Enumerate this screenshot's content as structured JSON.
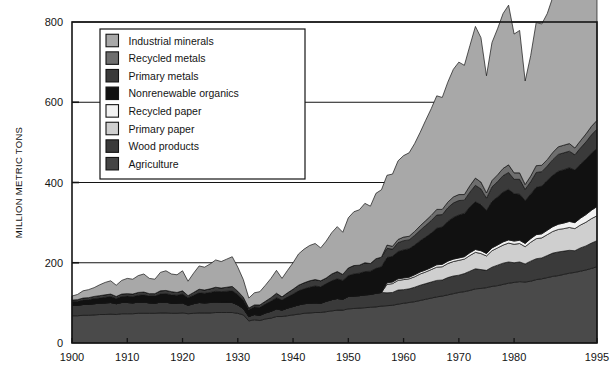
{
  "chart_data": {
    "type": "area",
    "title": "",
    "subtitle": "",
    "xlabel": "",
    "ylabel": "MILLION METRIC TONS",
    "xlim": [
      1900,
      1995
    ],
    "ylim": [
      0,
      800
    ],
    "ytick_labels": [
      "0",
      "200",
      "400",
      "600",
      "800"
    ],
    "yticks": [
      0,
      200,
      400,
      600,
      800
    ],
    "xtick_labels": [
      "1900",
      "1910",
      "1920",
      "1930",
      "1940",
      "1950",
      "1960",
      "1970",
      "1980",
      "1995"
    ],
    "xticks": [
      1900,
      1910,
      1920,
      1930,
      1940,
      1950,
      1960,
      1970,
      1980,
      1995
    ],
    "grid": "horizontal",
    "stacked": true,
    "legend_position": "upper-left-inset",
    "x": [
      1900,
      1901,
      1902,
      1903,
      1904,
      1905,
      1906,
      1907,
      1908,
      1909,
      1910,
      1911,
      1912,
      1913,
      1914,
      1915,
      1916,
      1917,
      1918,
      1919,
      1920,
      1921,
      1922,
      1923,
      1924,
      1925,
      1926,
      1927,
      1928,
      1929,
      1930,
      1931,
      1932,
      1933,
      1934,
      1935,
      1936,
      1937,
      1938,
      1939,
      1940,
      1941,
      1942,
      1943,
      1944,
      1945,
      1946,
      1947,
      1948,
      1949,
      1950,
      1951,
      1952,
      1953,
      1954,
      1955,
      1956,
      1957,
      1958,
      1959,
      1960,
      1961,
      1962,
      1963,
      1964,
      1965,
      1966,
      1967,
      1968,
      1969,
      1970,
      1971,
      1972,
      1973,
      1974,
      1975,
      1976,
      1977,
      1978,
      1979,
      1980,
      1981,
      1982,
      1983,
      1984,
      1985,
      1986,
      1987,
      1988,
      1989,
      1990,
      1991,
      1992,
      1993,
      1994,
      1995
    ],
    "series": [
      {
        "name": "Agriculture",
        "color": "#4a4a4a",
        "values": [
          68,
          68,
          69,
          69,
          70,
          71,
          71,
          72,
          71,
          73,
          73,
          73,
          74,
          74,
          74,
          74,
          75,
          75,
          74,
          74,
          75,
          73,
          74,
          75,
          75,
          75,
          76,
          76,
          76,
          76,
          74,
          70,
          55,
          58,
          56,
          60,
          62,
          66,
          66,
          68,
          70,
          72,
          74,
          75,
          76,
          76,
          78,
          80,
          82,
          82,
          85,
          86,
          87,
          88,
          89,
          90,
          92,
          93,
          94,
          97,
          99,
          101,
          103,
          106,
          109,
          112,
          115,
          117,
          120,
          123,
          126,
          128,
          131,
          135,
          136,
          138,
          141,
          143,
          146,
          149,
          151,
          153,
          152,
          154,
          158,
          160,
          163,
          166,
          168,
          171,
          174,
          176,
          179,
          182,
          186,
          190
        ]
      },
      {
        "name": "Wood products",
        "color": "#3a3a3a",
        "values": [
          26,
          26,
          27,
          27,
          28,
          28,
          29,
          29,
          27,
          28,
          28,
          27,
          28,
          28,
          26,
          25,
          27,
          27,
          25,
          25,
          25,
          21,
          24,
          26,
          25,
          26,
          26,
          25,
          25,
          25,
          21,
          16,
          11,
          13,
          13,
          15,
          17,
          19,
          16,
          19,
          21,
          23,
          24,
          24,
          24,
          23,
          26,
          28,
          29,
          27,
          31,
          31,
          31,
          32,
          32,
          34,
          34,
          32,
          32,
          35,
          34,
          34,
          36,
          38,
          39,
          40,
          41,
          40,
          43,
          44,
          43,
          45,
          48,
          50,
          47,
          43,
          48,
          51,
          53,
          53,
          49,
          49,
          45,
          50,
          52,
          52,
          55,
          58,
          59,
          58,
          57,
          54,
          58,
          60,
          63,
          65
        ]
      },
      {
        "name": "Primary paper",
        "color": "#cfcfcf",
        "values": [
          0,
          0,
          0,
          0,
          0,
          0,
          0,
          0,
          0,
          0,
          0,
          0,
          0,
          0,
          0,
          0,
          0,
          0,
          0,
          0,
          0,
          0,
          0,
          0,
          0,
          0,
          0,
          0,
          0,
          0,
          0,
          0,
          0,
          0,
          0,
          0,
          0,
          0,
          0,
          0,
          0,
          0,
          0,
          0,
          0,
          0,
          0,
          0,
          0,
          0,
          0,
          0,
          0,
          0,
          0,
          0,
          0,
          21,
          22,
          24,
          25,
          25,
          26,
          28,
          29,
          31,
          33,
          33,
          35,
          36,
          37,
          36,
          39,
          41,
          40,
          36,
          41,
          43,
          45,
          47,
          46,
          46,
          43,
          47,
          50,
          50,
          52,
          54,
          56,
          56,
          57,
          55,
          57,
          59,
          61,
          62
        ]
      },
      {
        "name": "Recycled paper",
        "color": "#f2f2f2",
        "values": [
          0,
          0,
          0,
          0,
          0,
          0,
          0,
          0,
          0,
          0,
          0,
          0,
          0,
          0,
          0,
          0,
          0,
          0,
          0,
          0,
          0,
          0,
          0,
          0,
          0,
          0,
          0,
          0,
          0,
          0,
          0,
          0,
          0,
          0,
          0,
          0,
          0,
          0,
          0,
          0,
          0,
          0,
          0,
          0,
          0,
          0,
          0,
          0,
          0,
          0,
          0,
          0,
          0,
          0,
          0,
          0,
          0,
          4,
          4,
          4,
          4,
          4,
          5,
          5,
          5,
          5,
          6,
          6,
          6,
          6,
          6,
          6,
          7,
          7,
          7,
          6,
          7,
          7,
          8,
          8,
          8,
          8,
          8,
          9,
          10,
          10,
          11,
          12,
          13,
          14,
          15,
          15,
          17,
          19,
          21,
          23
        ]
      },
      {
        "name": "Nonrenewable organics",
        "color": "#111111",
        "values": [
          9,
          10,
          11,
          12,
          13,
          13,
          14,
          15,
          13,
          15,
          16,
          16,
          17,
          18,
          17,
          18,
          20,
          21,
          21,
          20,
          22,
          19,
          21,
          24,
          24,
          25,
          27,
          27,
          28,
          29,
          26,
          22,
          17,
          19,
          20,
          22,
          25,
          28,
          25,
          28,
          31,
          35,
          37,
          40,
          42,
          41,
          44,
          47,
          49,
          47,
          52,
          55,
          56,
          58,
          58,
          62,
          64,
          63,
          64,
          68,
          70,
          71,
          74,
          78,
          82,
          86,
          91,
          93,
          99,
          104,
          107,
          108,
          114,
          119,
          115,
          107,
          116,
          120,
          124,
          126,
          118,
          115,
          107,
          111,
          118,
          119,
          124,
          128,
          132,
          133,
          134,
          131,
          135,
          138,
          142,
          145
        ]
      },
      {
        "name": "Primary metals",
        "color": "#3a3a3a",
        "values": [
          4,
          4,
          5,
          5,
          5,
          6,
          6,
          6,
          5,
          6,
          6,
          6,
          7,
          7,
          6,
          6,
          8,
          8,
          8,
          7,
          8,
          5,
          7,
          9,
          8,
          9,
          10,
          9,
          10,
          11,
          8,
          6,
          4,
          5,
          6,
          7,
          9,
          11,
          8,
          10,
          12,
          14,
          15,
          16,
          16,
          15,
          14,
          17,
          18,
          15,
          19,
          21,
          20,
          22,
          19,
          24,
          24,
          23,
          18,
          22,
          23,
          22,
          24,
          26,
          29,
          31,
          33,
          31,
          34,
          36,
          36,
          33,
          37,
          41,
          39,
          31,
          36,
          38,
          41,
          42,
          36,
          37,
          28,
          31,
          37,
          36,
          36,
          39,
          42,
          42,
          41,
          38,
          40,
          43,
          46,
          48
        ]
      },
      {
        "name": "Recycled metals",
        "color": "#6e6e6e",
        "values": [
          0,
          0,
          0,
          0,
          0,
          0,
          0,
          0,
          0,
          0,
          0,
          0,
          0,
          0,
          0,
          0,
          0,
          0,
          0,
          0,
          0,
          0,
          0,
          0,
          0,
          0,
          0,
          0,
          0,
          0,
          0,
          0,
          0,
          0,
          0,
          0,
          0,
          0,
          0,
          0,
          0,
          0,
          0,
          0,
          0,
          0,
          0,
          0,
          0,
          0,
          0,
          0,
          0,
          0,
          0,
          0,
          0,
          8,
          7,
          8,
          9,
          9,
          10,
          11,
          12,
          13,
          14,
          13,
          14,
          15,
          15,
          14,
          16,
          18,
          17,
          13,
          16,
          17,
          18,
          19,
          16,
          16,
          12,
          14,
          17,
          16,
          16,
          18,
          19,
          19,
          19,
          17,
          18,
          20,
          21,
          22
        ]
      },
      {
        "name": "Industrial minerals",
        "color": "#a8a8a8",
        "values": [
          10,
          13,
          18,
          20,
          22,
          27,
          31,
          33,
          28,
          34,
          38,
          37,
          42,
          45,
          38,
          36,
          46,
          49,
          44,
          44,
          50,
          36,
          48,
          58,
          57,
          62,
          68,
          66,
          70,
          74,
          60,
          44,
          25,
          30,
          33,
          40,
          48,
          57,
          46,
          56,
          66,
          78,
          84,
          88,
          90,
          82,
          92,
          103,
          112,
          105,
          125,
          134,
          138,
          148,
          143,
          163,
          168,
          174,
          180,
          196,
          203,
          208,
          219,
          233,
          250,
          266,
          283,
          279,
          299,
          318,
          330,
          322,
          349,
          378,
          360,
          292,
          344,
          364,
          386,
          398,
          346,
          355,
          258,
          300,
          357,
          352,
          364,
          387,
          404,
          406,
          404,
          372,
          392,
          418,
          440,
          466
        ]
      }
    ]
  },
  "legend": {
    "items": [
      {
        "label": "Industrial minerals",
        "color": "#a8a8a8"
      },
      {
        "label": "Recycled metals",
        "color": "#6e6e6e"
      },
      {
        "label": "Primary metals",
        "color": "#3a3a3a"
      },
      {
        "label": "Nonrenewable organics",
        "color": "#111111"
      },
      {
        "label": "Recycled paper",
        "color": "#f2f2f2"
      },
      {
        "label": "Primary paper",
        "color": "#cfcfcf"
      },
      {
        "label": "Wood products",
        "color": "#3a3a3a"
      },
      {
        "label": "Agriculture",
        "color": "#444444"
      }
    ]
  },
  "style": {
    "axis_color": "#141414",
    "grid_color": "#141414",
    "band_outline": "#141414",
    "background": "#ffffff"
  }
}
